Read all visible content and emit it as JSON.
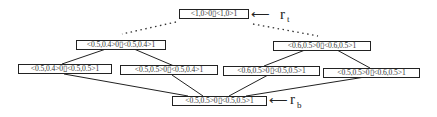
{
  "nodes": {
    "top": "<1,0>0▯<1,0>1",
    "mid_left": "<0.5,0.4>0▯<0.5,0.4>1",
    "mid_right": "<0.6,0.5>0▯<0.6,0.5>1",
    "low_1": "<0.5,0.4>0▯<0.5,0.5>1",
    "low_2": "<0.5,0.5>0▯<0.5,0.4>1",
    "low_3": "<0.6,0.5>0▯<0.5,0.5>1",
    "low_4": "<0.5,0.5>0▯<0.6,0.5>1",
    "bottom": "<0.5,0.5>0▯<0.5,0.5>1"
  },
  "labels": {
    "top_arrow": "⟵",
    "top_r": "r",
    "top_sub": "t",
    "bottom_arrow": "⟵",
    "bottom_r": "r",
    "bottom_sub": "b"
  },
  "edges": [
    {
      "from": "top",
      "to": "mid_left",
      "style": "dotted"
    },
    {
      "from": "top",
      "to": "mid_right",
      "style": "dotted"
    },
    {
      "from": "mid_left",
      "to": "low_1",
      "style": "solid"
    },
    {
      "from": "mid_left",
      "to": "low_2",
      "style": "solid"
    },
    {
      "from": "mid_right",
      "to": "low_3",
      "style": "solid"
    },
    {
      "from": "mid_right",
      "to": "low_4",
      "style": "solid"
    },
    {
      "from": "low_1",
      "to": "bottom",
      "style": "solid"
    },
    {
      "from": "low_2",
      "to": "bottom",
      "style": "solid"
    },
    {
      "from": "low_3",
      "to": "bottom",
      "style": "solid"
    },
    {
      "from": "low_4",
      "to": "bottom",
      "style": "solid"
    }
  ]
}
